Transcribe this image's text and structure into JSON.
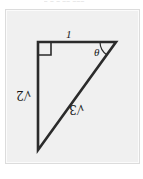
{
  "figure": {
    "type": "right-triangle-diagram",
    "panel_background_color": "#f0f0f0",
    "panel_border_color": "#dcdcdc",
    "stroke_color": "#2b2b2b",
    "labels": {
      "top_side": "1",
      "left_side": "√2",
      "hypotenuse": "√3",
      "angle": "θ"
    },
    "vertices": {
      "top_left": [
        36,
        32
      ],
      "top_right": [
        113,
        32
      ],
      "bottom_left": [
        36,
        141
      ]
    },
    "right_angle_marker_at": "top_left",
    "rotated_labels": [
      "left_side",
      "hypotenuse"
    ],
    "rotation_degrees": 180
  },
  "scan": {
    "top_clipped_text": "– –  –  –– –––"
  }
}
